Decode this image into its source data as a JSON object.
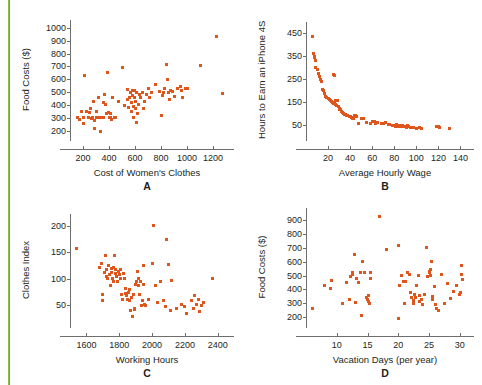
{
  "figure": {
    "caption_fragment": "",
    "accent_color": "#8cbf3f",
    "marker_color": "#e0551b",
    "axis_color": "#6e6e6e"
  },
  "chart_data": [
    {
      "panel": "A",
      "type": "scatter",
      "title": "",
      "xlabel": "Cost of Women's Clothes",
      "ylabel": "Food Costs ($)",
      "xlim": [
        100,
        1300
      ],
      "ylim": [
        150,
        1030
      ],
      "xticks": [
        200,
        400,
        600,
        800,
        1000,
        1200
      ],
      "yticks": [
        200,
        300,
        400,
        500,
        600,
        700,
        800,
        900,
        1000
      ],
      "grid": false,
      "legend": "none",
      "points": [
        [
          155,
          300
        ],
        [
          170,
          287
        ],
        [
          185,
          345
        ],
        [
          200,
          305
        ],
        [
          205,
          258
        ],
        [
          215,
          630
        ],
        [
          230,
          350
        ],
        [
          240,
          300
        ],
        [
          250,
          340
        ],
        [
          258,
          375
        ],
        [
          262,
          292
        ],
        [
          270,
          300
        ],
        [
          278,
          430
        ],
        [
          285,
          282
        ],
        [
          292,
          218
        ],
        [
          300,
          300
        ],
        [
          305,
          345
        ],
        [
          312,
          300
        ],
        [
          320,
          460
        ],
        [
          330,
          300
        ],
        [
          335,
          196
        ],
        [
          345,
          305
        ],
        [
          355,
          420
        ],
        [
          360,
          300
        ],
        [
          368,
          480
        ],
        [
          375,
          405
        ],
        [
          382,
          330
        ],
        [
          390,
          650
        ],
        [
          395,
          340
        ],
        [
          400,
          300
        ],
        [
          408,
          330
        ],
        [
          415,
          300
        ],
        [
          422,
          290
        ],
        [
          430,
          460
        ],
        [
          440,
          300
        ],
        [
          452,
          300
        ],
        [
          470,
          430
        ],
        [
          500,
          690
        ],
        [
          520,
          395
        ],
        [
          540,
          520
        ],
        [
          545,
          440
        ],
        [
          552,
          380
        ],
        [
          560,
          455
        ],
        [
          566,
          500
        ],
        [
          570,
          420
        ],
        [
          575,
          345
        ],
        [
          578,
          510
        ],
        [
          582,
          470
        ],
        [
          586,
          300
        ],
        [
          590,
          390
        ],
        [
          594,
          455
        ],
        [
          598,
          515
        ],
        [
          600,
          375
        ],
        [
          604,
          430
        ],
        [
          608,
          500
        ],
        [
          612,
          265
        ],
        [
          618,
          330
        ],
        [
          625,
          405
        ],
        [
          635,
          480
        ],
        [
          645,
          455
        ],
        [
          655,
          500
        ],
        [
          662,
          370
        ],
        [
          670,
          430
        ],
        [
          690,
          480
        ],
        [
          700,
          525
        ],
        [
          715,
          460
        ],
        [
          730,
          500
        ],
        [
          760,
          560
        ],
        [
          790,
          505
        ],
        [
          800,
          315
        ],
        [
          812,
          475
        ],
        [
          820,
          500
        ],
        [
          830,
          525
        ],
        [
          840,
          715
        ],
        [
          848,
          600
        ],
        [
          855,
          500
        ],
        [
          862,
          440
        ],
        [
          875,
          515
        ],
        [
          890,
          505
        ],
        [
          905,
          465
        ],
        [
          930,
          530
        ],
        [
          950,
          545
        ],
        [
          960,
          510
        ],
        [
          968,
          455
        ],
        [
          985,
          530
        ],
        [
          1000,
          525
        ],
        [
          1100,
          705
        ],
        [
          1230,
          935
        ],
        [
          1270,
          485
        ]
      ]
    },
    {
      "panel": "B",
      "type": "scatter",
      "title": "",
      "xlabel": "Average Hourly Wage",
      "ylabel": "Hours to Earn an iPhone 4S",
      "xlim": [
        0,
        145
      ],
      "ylim": [
        0,
        480
      ],
      "xticks": [
        20,
        40,
        60,
        80,
        100,
        120,
        140
      ],
      "yticks": [
        50,
        150,
        250,
        350,
        450
      ],
      "grid": false,
      "legend": "none",
      "points": [
        [
          6,
          435
        ],
        [
          7,
          360
        ],
        [
          7.5,
          350
        ],
        [
          8,
          345
        ],
        [
          8.5,
          330
        ],
        [
          9,
          300
        ],
        [
          10,
          290
        ],
        [
          11,
          275
        ],
        [
          12,
          260
        ],
        [
          13,
          250
        ],
        [
          14,
          240
        ],
        [
          15,
          205
        ],
        [
          16,
          200
        ],
        [
          17,
          190
        ],
        [
          18,
          175
        ],
        [
          19,
          170
        ],
        [
          20,
          168
        ],
        [
          21,
          162
        ],
        [
          22,
          160
        ],
        [
          22.5,
          158
        ],
        [
          23,
          155
        ],
        [
          23.5,
          152
        ],
        [
          24,
          150
        ],
        [
          24.5,
          148
        ],
        [
          25,
          146
        ],
        [
          25.5,
          150
        ],
        [
          26,
          145
        ],
        [
          26.5,
          158
        ],
        [
          27,
          142
        ],
        [
          28,
          138
        ],
        [
          28.5,
          160
        ],
        [
          29,
          130
        ],
        [
          30,
          125
        ],
        [
          30.5,
          120
        ],
        [
          31,
          118
        ],
        [
          32,
          112
        ],
        [
          33,
          108
        ],
        [
          25,
          270
        ],
        [
          26,
          265
        ],
        [
          34,
          100
        ],
        [
          35,
          98
        ],
        [
          36,
          96
        ],
        [
          37,
          95
        ],
        [
          38,
          92
        ],
        [
          39,
          90
        ],
        [
          40,
          88
        ],
        [
          41,
          85
        ],
        [
          42,
          80
        ],
        [
          43,
          78
        ],
        [
          44,
          95
        ],
        [
          45,
          92
        ],
        [
          46,
          90
        ],
        [
          48,
          60
        ],
        [
          50,
          80
        ],
        [
          52,
          78
        ],
        [
          55,
          62
        ],
        [
          58,
          60
        ],
        [
          60,
          65
        ],
        [
          62,
          68
        ],
        [
          63,
          58
        ],
        [
          65,
          62
        ],
        [
          68,
          60
        ],
        [
          70,
          58
        ],
        [
          72,
          62
        ],
        [
          75,
          55
        ],
        [
          76,
          52
        ],
        [
          78,
          50
        ],
        [
          79,
          48
        ],
        [
          80,
          50
        ],
        [
          81,
          47
        ],
        [
          82,
          52
        ],
        [
          83,
          48
        ],
        [
          84,
          46
        ],
        [
          85,
          50
        ],
        [
          86,
          45
        ],
        [
          87,
          48
        ],
        [
          88,
          44
        ],
        [
          89,
          46
        ],
        [
          90,
          45
        ],
        [
          91,
          42
        ],
        [
          92,
          48
        ],
        [
          93,
          44
        ],
        [
          95,
          42
        ],
        [
          97,
          40
        ],
        [
          100,
          38
        ],
        [
          103,
          40
        ],
        [
          105,
          36
        ],
        [
          118,
          45
        ],
        [
          120,
          44
        ],
        [
          121,
          40
        ],
        [
          130,
          38
        ]
      ]
    },
    {
      "panel": "C",
      "type": "scatter",
      "title": "",
      "xlabel": "Working Hours",
      "ylabel": "Clothes Index",
      "xlim": [
        1500,
        2450
      ],
      "ylim": [
        15,
        215
      ],
      "xticks": [
        1600,
        1800,
        2000,
        2200,
        2400
      ],
      "yticks": [
        50,
        100,
        150,
        200
      ],
      "grid": false,
      "legend": "none",
      "points": [
        [
          1540,
          157
        ],
        [
          1680,
          122
        ],
        [
          1690,
          130
        ],
        [
          1695,
          60
        ],
        [
          1700,
          70
        ],
        [
          1710,
          112
        ],
        [
          1715,
          145
        ],
        [
          1720,
          105
        ],
        [
          1725,
          118
        ],
        [
          1730,
          100
        ],
        [
          1735,
          125
        ],
        [
          1740,
          108
        ],
        [
          1745,
          88
        ],
        [
          1750,
          120
        ],
        [
          1755,
          112
        ],
        [
          1758,
          100
        ],
        [
          1762,
          95
        ],
        [
          1765,
          122
        ],
        [
          1770,
          145
        ],
        [
          1775,
          118
        ],
        [
          1780,
          110
        ],
        [
          1785,
          105
        ],
        [
          1790,
          95
        ],
        [
          1795,
          115
        ],
        [
          1800,
          108
        ],
        [
          1805,
          100
        ],
        [
          1810,
          118
        ],
        [
          1815,
          70
        ],
        [
          1820,
          62
        ],
        [
          1825,
          110
        ],
        [
          1830,
          100
        ],
        [
          1835,
          82
        ],
        [
          1840,
          72
        ],
        [
          1845,
          68
        ],
        [
          1850,
          62
        ],
        [
          1855,
          75
        ],
        [
          1860,
          60
        ],
        [
          1865,
          80
        ],
        [
          1870,
          40
        ],
        [
          1875,
          65
        ],
        [
          1880,
          30
        ],
        [
          1885,
          70
        ],
        [
          1890,
          42
        ],
        [
          1895,
          44
        ],
        [
          1900,
          90
        ],
        [
          1905,
          95
        ],
        [
          1910,
          115
        ],
        [
          1915,
          100
        ],
        [
          1920,
          88
        ],
        [
          1925,
          70
        ],
        [
          1930,
          96
        ],
        [
          1935,
          50
        ],
        [
          1940,
          60
        ],
        [
          1945,
          126
        ],
        [
          1950,
          90
        ],
        [
          1955,
          52
        ],
        [
          1960,
          50
        ],
        [
          1980,
          62
        ],
        [
          2000,
          130
        ],
        [
          2010,
          200
        ],
        [
          2020,
          88
        ],
        [
          2030,
          55
        ],
        [
          2050,
          95
        ],
        [
          2070,
          60
        ],
        [
          2080,
          48
        ],
        [
          2090,
          175
        ],
        [
          2100,
          128
        ],
        [
          2110,
          40
        ],
        [
          2120,
          98
        ],
        [
          2150,
          45
        ],
        [
          2180,
          52
        ],
        [
          2200,
          48
        ],
        [
          2210,
          35
        ],
        [
          2240,
          60
        ],
        [
          2250,
          45
        ],
        [
          2260,
          68
        ],
        [
          2270,
          52
        ],
        [
          2280,
          62
        ],
        [
          2290,
          38
        ],
        [
          2300,
          50
        ],
        [
          2310,
          55
        ],
        [
          2370,
          100
        ]
      ]
    },
    {
      "panel": "D",
      "type": "scatter",
      "title": "",
      "xlabel": "Vacation Days (per year)",
      "ylabel": "Food Costs ($)",
      "xlim": [
        5,
        31
      ],
      "ylim": [
        150,
        960
      ],
      "xticks": [
        10,
        15,
        20,
        25,
        30
      ],
      "yticks": [
        200,
        300,
        400,
        500,
        600,
        700,
        800,
        900
      ],
      "grid": false,
      "legend": "none",
      "points": [
        [
          6,
          265
        ],
        [
          8,
          425
        ],
        [
          9,
          405
        ],
        [
          9.2,
          465
        ],
        [
          11,
          295
        ],
        [
          11.5,
          450
        ],
        [
          12,
          330
        ],
        [
          12.2,
          495
        ],
        [
          12.5,
          510
        ],
        [
          12.6,
          525
        ],
        [
          12.8,
          650
        ],
        [
          13,
          305
        ],
        [
          13.2,
          480
        ],
        [
          13.5,
          450
        ],
        [
          13.8,
          520
        ],
        [
          14,
          215
        ],
        [
          14.2,
          600
        ],
        [
          14.5,
          520
        ],
        [
          14.8,
          345
        ],
        [
          15,
          330
        ],
        [
          15.1,
          355
        ],
        [
          15.2,
          310
        ],
        [
          15.3,
          300
        ],
        [
          15.4,
          480
        ],
        [
          15.5,
          520
        ],
        [
          17,
          930
        ],
        [
          18,
          690
        ],
        [
          20,
          190
        ],
        [
          20,
          715
        ],
        [
          20.2,
          430
        ],
        [
          20.5,
          500
        ],
        [
          20.8,
          455
        ],
        [
          21,
          295
        ],
        [
          21.2,
          460
        ],
        [
          21.5,
          520
        ],
        [
          21.8,
          505
        ],
        [
          22,
          380
        ],
        [
          22.2,
          340
        ],
        [
          22.4,
          320
        ],
        [
          22.5,
          300
        ],
        [
          22.6,
          360
        ],
        [
          22.8,
          345
        ],
        [
          23,
          430
        ],
        [
          23.2,
          500
        ],
        [
          23.4,
          310
        ],
        [
          23.5,
          355
        ],
        [
          23.8,
          330
        ],
        [
          24,
          290
        ],
        [
          24.2,
          360
        ],
        [
          24.5,
          705
        ],
        [
          24.8,
          490
        ],
        [
          25,
          530
        ],
        [
          25.1,
          520
        ],
        [
          25.2,
          500
        ],
        [
          25.3,
          545
        ],
        [
          25.4,
          600
        ],
        [
          25.5,
          350
        ],
        [
          25.6,
          330
        ],
        [
          25.8,
          420
        ],
        [
          26,
          290
        ],
        [
          26.2,
          265
        ],
        [
          26.5,
          250
        ],
        [
          27,
          505
        ],
        [
          27.5,
          300
        ],
        [
          28,
          440
        ],
        [
          28.5,
          335
        ],
        [
          29,
          385
        ],
        [
          29.5,
          430
        ],
        [
          30,
          360
        ],
        [
          30.1,
          380
        ],
        [
          30.2,
          505
        ],
        [
          30.3,
          570
        ],
        [
          30.4,
          475
        ]
      ]
    }
  ]
}
